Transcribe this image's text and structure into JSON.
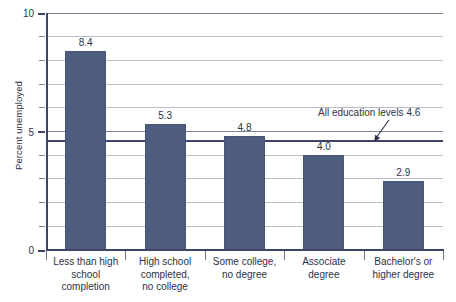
{
  "chart_data": {
    "type": "bar",
    "title": "",
    "xlabel": "",
    "ylabel": "Percent unemployed",
    "ylim": [
      0,
      10
    ],
    "ytick_values": [
      0,
      5,
      10
    ],
    "ytick_labels": [
      "0",
      "5",
      "10"
    ],
    "minor_gridline_step": 1,
    "grid": true,
    "legend": "none",
    "categories": [
      "Less than high school completion",
      "High school completed, no college",
      "Some college, no degree",
      "Associate degree",
      "Bachelor's or higher degree"
    ],
    "category_label_lines": [
      [
        "Less than high",
        "school",
        "completion"
      ],
      [
        "High school",
        "completed,",
        "no college"
      ],
      [
        "Some college,",
        "no degree"
      ],
      [
        "Associate",
        "degree"
      ],
      [
        "Bachelor's or",
        "higher degree"
      ]
    ],
    "values": [
      8.4,
      5.3,
      4.8,
      4.0,
      2.9
    ],
    "value_labels": [
      "8.4",
      "5.3",
      "4.8",
      "4.0",
      "2.9"
    ],
    "reference_line": {
      "value": 4.6,
      "label": "All education levels 4.6",
      "color": "#3c4664"
    },
    "colors": {
      "bar": "#4d5c7f",
      "bar_border": "#47557a",
      "axis": "#3c4664",
      "gridline": "#b9bdc9",
      "text": "#2b3247",
      "background": "#ffffff"
    }
  }
}
